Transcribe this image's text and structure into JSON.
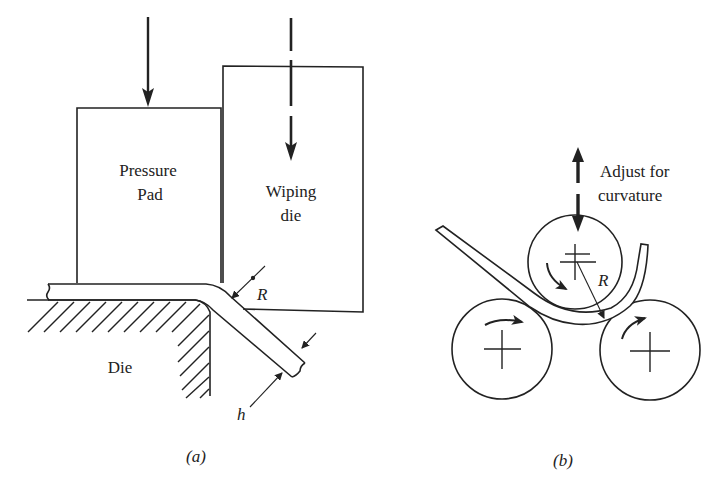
{
  "figure": {
    "panel_a": {
      "caption": "(a)",
      "labels": {
        "pressure_pad_line1": "Pressure",
        "pressure_pad_line2": "Pad",
        "wiping_die_line1": "Wiping",
        "wiping_die_line2": "die",
        "die": "Die",
        "radius": "R",
        "thickness": "h"
      }
    },
    "panel_b": {
      "caption": "(b)",
      "labels": {
        "adjust_line1": "Adjust for",
        "adjust_line2": "curvature",
        "radius": "R"
      }
    },
    "colors": {
      "ink": "#222222",
      "background": "#ffffff"
    }
  }
}
